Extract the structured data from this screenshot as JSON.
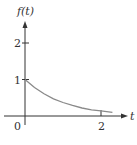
{
  "chart_data": {
    "type": "line",
    "title": "",
    "xlabel": "t",
    "ylabel": "f(t)",
    "origin_label": "0",
    "x_ticks": [
      {
        "value": 2,
        "label": "2"
      }
    ],
    "y_ticks": [
      {
        "value": 1,
        "label": "1"
      },
      {
        "value": 2,
        "label": "2"
      }
    ],
    "xlim": [
      0,
      2.3
    ],
    "ylim": [
      0,
      2.5
    ],
    "grid": false,
    "legend": null,
    "series": [
      {
        "name": "f(t)",
        "x": [
          0,
          0.25,
          0.5,
          0.75,
          1.0,
          1.25,
          1.5,
          1.75,
          2.0,
          2.3
        ],
        "y": [
          1.0,
          0.78,
          0.61,
          0.47,
          0.37,
          0.29,
          0.22,
          0.17,
          0.14,
          0.1
        ]
      }
    ],
    "colors": {
      "axis": "#333333",
      "curve": "#8a8a8a"
    }
  }
}
